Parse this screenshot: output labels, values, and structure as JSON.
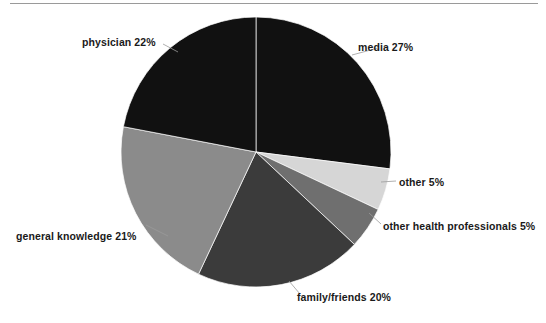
{
  "figure": {
    "name": "pie-chart-sources-of-information",
    "background": "#ffffff",
    "top_rule_color": "#9a9a9a"
  },
  "chart_data": {
    "type": "pie",
    "title": "",
    "xlabel": "",
    "ylabel": "",
    "legend_position": "none",
    "grid": false,
    "total": 100,
    "units": "%",
    "start_angle_deg": 0,
    "direction": "clockwise",
    "center": {
      "x": 256,
      "y": 152
    },
    "radius": 135,
    "categories": [
      "media",
      "other",
      "other health professionals",
      "family/friends",
      "general knowledge",
      "physician"
    ],
    "values": [
      27,
      5,
      5,
      20,
      21,
      22
    ],
    "colors": [
      "#111111",
      "#d6d6d6",
      "#6f6f6f",
      "#3b3b3b",
      "#8b8b8b",
      "#111111"
    ],
    "slices": [
      {
        "label": "media 27%",
        "name": "media",
        "value": 27,
        "color": "#111111",
        "start_deg": 0,
        "end_deg": 97.2,
        "path": "M256,152 L256,17 A135,135 0 0,1 389.9,169.2 Z",
        "leader": "M352,55 L378,48"
      },
      {
        "label": "other 5%",
        "name": "other",
        "value": 5,
        "color": "#d6d6d6",
        "start_deg": 97.2,
        "end_deg": 115.2,
        "path": "M256,152 L389.9,169.2 A135,135 0 0,1 378.1,194.2 Z",
        "leader": "M381,182 L396,181"
      },
      {
        "label": "other health professionals 5%",
        "name": "other-health-professionals",
        "value": 5,
        "color": "#6f6f6f",
        "start_deg": 115.2,
        "end_deg": 133.2,
        "path": "M256,152 L378.1,194.2 A135,135 0 0,1 354.4,223.4 Z",
        "leader": "M369,213 L381,224"
      },
      {
        "label": "family/friends 20%",
        "name": "family-friends",
        "value": 20,
        "color": "#3b3b3b",
        "start_deg": 133.2,
        "end_deg": 205.2,
        "path": "M256,152 L354.4,223.4 A135,135 0 0,1 198.8,278.1 Z",
        "leader": "M289,281 L300,294"
      },
      {
        "label": "general knowledge 21%",
        "name": "general-knowledge",
        "value": 21,
        "color": "#8b8b8b",
        "start_deg": 205.2,
        "end_deg": 280.8,
        "path": "M256,152 L198.8,278.1 A135,135 0 0,1 130.6,127.0 Z",
        "leader": "M146,225 L168,236"
      },
      {
        "label": "physician 22%",
        "name": "physician",
        "value": 22,
        "color": "#111111",
        "start_deg": 280.8,
        "end_deg": 360,
        "path": "M256,152 L130.6,127.0 A135,135 0 0,1 256,17 Z",
        "leader": "M178,52 L163,44"
      }
    ]
  },
  "labels": {
    "media": "media 27%",
    "physician": "physician 22%",
    "other": "other 5%",
    "other_health_professionals": "other health professionals 5%",
    "family_friends": "family/friends 20%",
    "general_knowledge": "general knowledge 21%"
  }
}
